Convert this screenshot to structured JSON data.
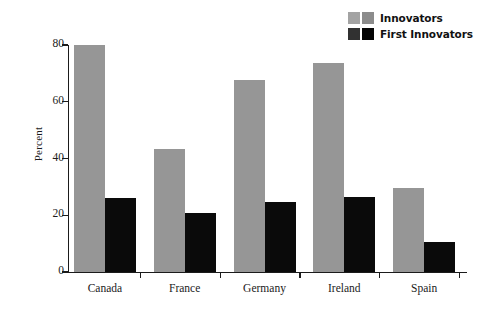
{
  "chart_data": {
    "type": "bar",
    "title": "",
    "subtitle": "",
    "xlabel": "",
    "ylabel": "Percent",
    "ylim": [
      0,
      80
    ],
    "yticks": [
      0,
      20,
      40,
      60,
      80
    ],
    "ytick_labels": [
      "0",
      "20",
      "40",
      "60",
      "80"
    ],
    "grid": false,
    "legend_position": "top-right",
    "categories": [
      "Canada",
      "France",
      "Germany",
      "Ireland",
      "Spain"
    ],
    "series": [
      {
        "name": "Innovators",
        "color": "#969696",
        "values": [
          80,
          43.5,
          67.5,
          73.5,
          29.5
        ]
      },
      {
        "name": "First Innovators",
        "color": "#0a0a0a",
        "values": [
          26,
          20.8,
          24.5,
          26.4,
          10.5
        ]
      }
    ]
  },
  "legend": {
    "items": [
      {
        "label": "Innovators",
        "color": "#969696"
      },
      {
        "label": "First Innovators",
        "color": "#0a0a0a"
      }
    ]
  },
  "axes": {
    "y_title": "Percent"
  }
}
